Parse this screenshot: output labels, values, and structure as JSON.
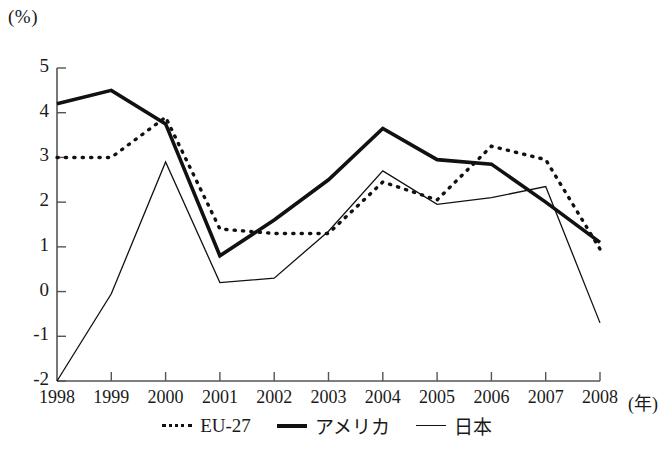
{
  "chart_data": {
    "type": "line",
    "title": "",
    "xlabel": "年",
    "ylabel": "(%)",
    "unit_label": "(%)",
    "x_unit_label": "(年)",
    "categories": [
      "1998",
      "1999",
      "2000",
      "2001",
      "2002",
      "2003",
      "2004",
      "2005",
      "2006",
      "2007",
      "2008"
    ],
    "x": [
      1998,
      1999,
      2000,
      2001,
      2002,
      2003,
      2004,
      2005,
      2006,
      2007,
      2008
    ],
    "xlim": [
      1998,
      2008
    ],
    "ylim": [
      -2,
      5
    ],
    "yticks": [
      "5",
      "4",
      "3",
      "2",
      "1",
      "0",
      "-1",
      "-2"
    ],
    "ytick_values": [
      5,
      4,
      3,
      2,
      1,
      0,
      -1,
      -2
    ],
    "grid": false,
    "legend_position": "bottom",
    "series": [
      {
        "name": "EU-27",
        "style": "dashed",
        "color": "#111111",
        "values": [
          3.0,
          3.0,
          3.9,
          1.4,
          1.3,
          1.3,
          2.45,
          2.05,
          3.25,
          2.95,
          0.95
        ]
      },
      {
        "name": "アメリカ",
        "style": "thick-solid",
        "color": "#111111",
        "values": [
          4.2,
          4.5,
          3.75,
          0.8,
          1.6,
          2.5,
          3.65,
          2.95,
          2.85,
          2.0,
          1.1
        ]
      },
      {
        "name": "日本",
        "style": "thin-solid",
        "color": "#111111",
        "values": [
          -2.0,
          -0.05,
          2.9,
          0.2,
          0.3,
          1.35,
          2.7,
          1.95,
          2.1,
          2.35,
          -0.7
        ]
      }
    ]
  }
}
